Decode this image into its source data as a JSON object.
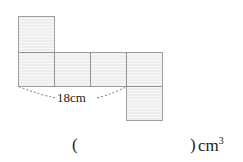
{
  "diagram": {
    "type": "cube-net",
    "dimension_label": "18cm",
    "colors": {
      "face_fill": "#ececec",
      "stripe": "#f7f7f7",
      "edge": "#9a9a9a",
      "fold": "#8a8a8a"
    }
  },
  "answer": {
    "open_paren": "(",
    "close_paren": ")",
    "unit": "cm",
    "unit_exponent": "3"
  }
}
